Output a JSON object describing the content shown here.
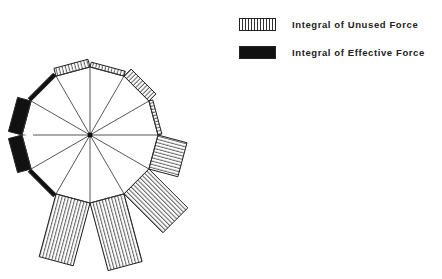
{
  "legend": {
    "items": [
      {
        "label": "Integral of Unused Force",
        "pattern": "vertical-hatch",
        "color": "#333333"
      },
      {
        "label": "Integral of Effective Force",
        "pattern": "solid",
        "color": "#111111"
      }
    ]
  },
  "diagram": {
    "type": "polar-dodecagon-bar-diagram",
    "center": [
      90,
      135
    ],
    "radius": 68,
    "sides": 12,
    "line_color": "#333333",
    "edges": [
      {
        "from_deg": 0,
        "to_deg": 30,
        "kind": "unused",
        "length": 30
      },
      {
        "from_deg": 30,
        "to_deg": 60,
        "kind": "unused",
        "length": 55
      },
      {
        "from_deg": 60,
        "to_deg": 90,
        "kind": "unused",
        "length": 70
      },
      {
        "from_deg": 90,
        "to_deg": 120,
        "kind": "unused",
        "length": 65
      },
      {
        "from_deg": 120,
        "to_deg": 150,
        "kind": "effective",
        "length": 4
      },
      {
        "from_deg": 150,
        "to_deg": 180,
        "kind": "effective",
        "length": 14
      },
      {
        "from_deg": 180,
        "to_deg": 210,
        "kind": "effective",
        "length": 14
      },
      {
        "from_deg": 210,
        "to_deg": 240,
        "kind": "effective",
        "length": 4
      },
      {
        "from_deg": 240,
        "to_deg": 270,
        "kind": "unused",
        "length": 8
      },
      {
        "from_deg": 270,
        "to_deg": 300,
        "kind": "unused",
        "length": 5
      },
      {
        "from_deg": 300,
        "to_deg": 330,
        "kind": "unused",
        "length": 10
      },
      {
        "from_deg": 330,
        "to_deg": 360,
        "kind": "unused",
        "length": 4
      }
    ]
  }
}
